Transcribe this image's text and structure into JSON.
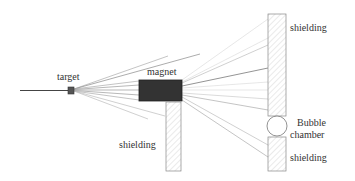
{
  "labels": {
    "target": "target",
    "magnet": "magnet",
    "shielding_lower": "shielding",
    "shielding_upper_right": "shielding",
    "bubble_line1": "Bubble",
    "bubble_line2": "chamber",
    "shielding_lower_right": "shielding"
  },
  "colors": {
    "magnet_fill": "#333333",
    "target_fill": "#555555",
    "shielding_hatch": "#d8d8d8",
    "beam": "#444444",
    "outline": "#888888"
  },
  "components": [
    {
      "name": "beam",
      "label": ""
    },
    {
      "name": "target",
      "label": "target"
    },
    {
      "name": "magnet",
      "label": "magnet"
    },
    {
      "name": "shielding",
      "label": "shielding"
    },
    {
      "name": "shielding",
      "label": "shielding"
    },
    {
      "name": "bubble-chamber",
      "label": "Bubble chamber"
    },
    {
      "name": "shielding",
      "label": "shielding"
    }
  ]
}
